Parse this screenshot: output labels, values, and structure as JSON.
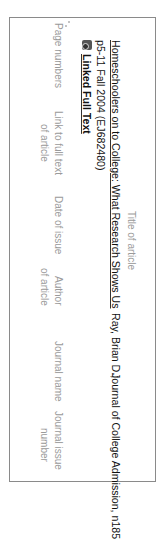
{
  "citation": {
    "title": "Homeschoolers on to College: What Research Shows Us",
    "author": "Ray, Brian D.;",
    "journal": "Journal of College Admission, n185",
    "pages_date_id": "p5-11 Fall 2004 (EJ682480)",
    "full_text_link": "Linked Full Text",
    "full_text_icon": "pdf-document-icon"
  },
  "annotations": {
    "title": "Title of article",
    "pages": "Page numbers",
    "link_line1": "Link to full text",
    "link_line2": "of article",
    "date": "Date of issue",
    "author_line1": "Author",
    "author_line2": "of article",
    "journal_name": "Journal name",
    "issue_line1": "Journal issue",
    "issue_line2": "number"
  },
  "colors": {
    "frame": "#8a8a8a",
    "annotation_text": "#9a9a9a",
    "arrow": "#8a8a8a",
    "citation_text": "#111111"
  }
}
